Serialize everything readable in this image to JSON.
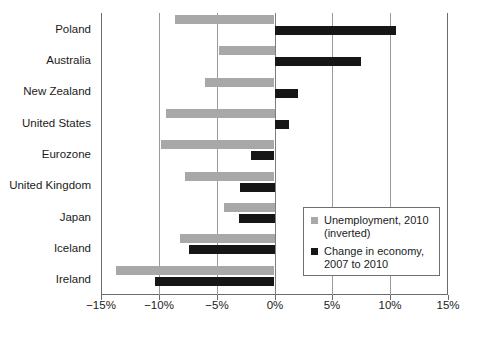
{
  "chart_data": {
    "type": "bar",
    "orientation": "horizontal",
    "title": "",
    "xlabel": "",
    "ylabel": "",
    "xlim": [
      -15,
      15
    ],
    "xticks": [
      -15,
      -10,
      -5,
      0,
      5,
      10,
      15
    ],
    "xtick_labels": [
      "−15%",
      "−10%",
      "−5%",
      "0%",
      "5%",
      "10%",
      "15%"
    ],
    "grid": true,
    "grid_axis": "x",
    "legend_position": "center-right",
    "categories": [
      "Poland",
      "Australia",
      "New Zealand",
      "United States",
      "Eurozone",
      "United Kingdom",
      "Japan",
      "Iceland",
      "Ireland"
    ],
    "series": [
      {
        "name": "Unemployment, 2010\n(inverted)",
        "color": "#a8a8a8",
        "values": [
          -8.6,
          -4.8,
          -6.0,
          -9.4,
          -9.8,
          -7.7,
          -4.4,
          -8.2,
          -13.7
        ]
      },
      {
        "name": "Change in economy,\n2007 to 2010",
        "color": "#161616",
        "values": [
          10.5,
          7.4,
          2.0,
          1.2,
          -2.0,
          -3.0,
          -3.1,
          -7.4,
          -10.3
        ]
      }
    ]
  },
  "legend": {
    "entries": [
      {
        "label": "Unemployment, 2010\n(inverted)",
        "swatch": "gray"
      },
      {
        "label": "Change in economy,\n2007 to 2010",
        "swatch": "black"
      }
    ]
  },
  "caption": {
    "text": ""
  }
}
